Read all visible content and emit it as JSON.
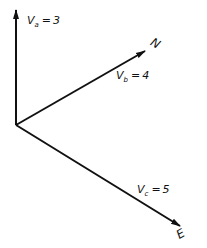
{
  "diagram": {
    "type": "vector-axes",
    "color": "#111111",
    "vectors": [
      {
        "id": "a",
        "symbol": "V",
        "subscript": "a",
        "equals": "=",
        "value": "3",
        "direction": ""
      },
      {
        "id": "b",
        "symbol": "V",
        "subscript": "b",
        "equals": "=",
        "value": "4",
        "direction": "N"
      },
      {
        "id": "c",
        "symbol": "V",
        "subscript": "c",
        "equals": "=",
        "value": "5",
        "direction": "E"
      }
    ]
  }
}
